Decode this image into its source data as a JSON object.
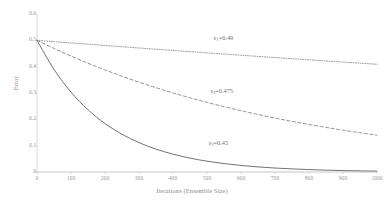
{
  "chart_data": {
    "type": "line",
    "title": "",
    "xlabel": "Iterations (Ensemble Size)",
    "ylabel": "Error",
    "xlim": [
      0,
      1000
    ],
    "ylim": [
      0,
      0.6
    ],
    "grid": true,
    "legend_position": "inline-annotations",
    "x_ticks": [
      "0",
      "100",
      "200",
      "300",
      "400",
      "500",
      "600",
      "700",
      "800",
      "900",
      "1000"
    ],
    "x_tick_values": [
      0,
      100,
      200,
      300,
      400,
      500,
      600,
      700,
      800,
      900,
      1000
    ],
    "y_ticks": [
      "0",
      "0.1",
      "0.2",
      "0.3",
      "0.4",
      "0.5",
      "0.6"
    ],
    "y_tick_values": [
      0,
      0.1,
      0.2,
      0.3,
      0.4,
      0.5,
      0.6
    ],
    "x": [
      0,
      50,
      100,
      150,
      200,
      250,
      300,
      350,
      400,
      450,
      500,
      550,
      600,
      650,
      700,
      750,
      800,
      850,
      900,
      950,
      1000
    ],
    "series": [
      {
        "name": "eps1",
        "label": "ε",
        "label_sub": "1",
        "label_value": "=0.49",
        "label_full": "ε₁=0.49",
        "epsilon": 0.49,
        "style": "dotted",
        "color": "#7f7f7f",
        "values": [
          0.5,
          0.4951,
          0.4901,
          0.4853,
          0.4804,
          0.4757,
          0.4709,
          0.4662,
          0.4616,
          0.457,
          0.4524,
          0.4479,
          0.4434,
          0.439,
          0.4346,
          0.4303,
          0.4259,
          0.4217,
          0.4175,
          0.4133,
          0.4091
        ],
        "end_value": 0.409
      },
      {
        "name": "eps2",
        "label": "ε",
        "label_sub": "2",
        "label_value": "=0.475",
        "label_full": "ε₂=0.475",
        "epsilon": 0.475,
        "style": "dashed",
        "color": "#7f7f7f",
        "values": [
          0.5,
          0.4692,
          0.4402,
          0.4131,
          0.3876,
          0.3637,
          0.3412,
          0.3201,
          0.3003,
          0.2818,
          0.2644,
          0.2481,
          0.2328,
          0.2184,
          0.2049,
          0.1923,
          0.1804,
          0.1693,
          0.1588,
          0.149,
          0.1398
        ],
        "end_value": 0.14
      },
      {
        "name": "eps3",
        "label": "ε",
        "label_sub": "3",
        "label_value": "=0.45",
        "label_full": "ε₃=0.45",
        "epsilon": 0.45,
        "style": "solid",
        "color": "#6b6b6b",
        "values": [
          0.5,
          0.3894,
          0.3033,
          0.2362,
          0.1839,
          0.1433,
          0.1116,
          0.0869,
          0.0677,
          0.0527,
          0.041,
          0.032,
          0.0249,
          0.0194,
          0.0151,
          0.0118,
          0.0092,
          0.0071,
          0.0055,
          0.0043,
          0.0034
        ],
        "end_value": 0.003
      }
    ],
    "annotations": [
      {
        "name": "eps1-annotation",
        "text": "ε₁=0.49",
        "x": 520,
        "y": 0.505
      },
      {
        "name": "eps2-annotation",
        "text": "ε₂=0.475",
        "x": 510,
        "y": 0.305
      },
      {
        "name": "eps3-annotation",
        "text": "ε₃=0.45",
        "x": 505,
        "y": 0.105
      }
    ],
    "colors": {
      "axis": "#c8c8c8",
      "gridline": "#d9d9d9",
      "tick_text": "#9a9a9a",
      "label_text": "#8a8a8a",
      "series_solid": "#6b6b6b",
      "series_dashed": "#7f7f7f",
      "series_dotted": "#7f7f7f",
      "background": "#ffffff"
    }
  }
}
